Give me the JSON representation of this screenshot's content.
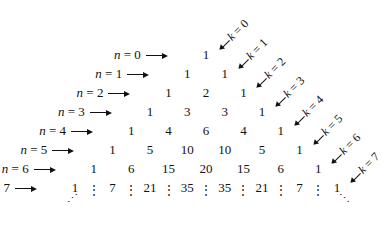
{
  "rows": [
    {
      "label_var": "n",
      "label_eq": " = 0",
      "values": [
        "1"
      ]
    },
    {
      "label_var": "n",
      "label_eq": " = 1",
      "values": [
        "1",
        "1"
      ]
    },
    {
      "label_var": "n",
      "label_eq": " = 2",
      "values": [
        "1",
        "2",
        "1"
      ]
    },
    {
      "label_var": "n",
      "label_eq": " = 3",
      "values": [
        "1",
        "3",
        "3",
        "1"
      ]
    },
    {
      "label_var": "n",
      "label_eq": " = 4",
      "values": [
        "1",
        "4",
        "6",
        "4",
        "1"
      ]
    },
    {
      "label_var": "n",
      "label_eq": " = 5",
      "values": [
        "1",
        "5",
        "10",
        "10",
        "5",
        "1"
      ]
    },
    {
      "label_var": "n",
      "label_eq": " = 6",
      "values": [
        "1",
        "6",
        "15",
        "20",
        "15",
        "6",
        "1"
      ]
    },
    {
      "label_var": "n",
      "label_eq": " = 7",
      "values": [
        "1",
        "7",
        "21",
        "35",
        "35",
        "21",
        "7",
        "1"
      ]
    }
  ],
  "diagonals": [
    {
      "var": "k",
      "eq": " = 0"
    },
    {
      "var": "k",
      "eq": " = 1"
    },
    {
      "var": "k",
      "eq": " = 2"
    },
    {
      "var": "k",
      "eq": " = 3"
    },
    {
      "var": "k",
      "eq": " = 4"
    },
    {
      "var": "k",
      "eq": " = 5"
    },
    {
      "var": "k",
      "eq": " = 6"
    },
    {
      "var": "k",
      "eq": " = 7"
    }
  ],
  "continuation": {
    "vertical": "⋮",
    "left_diag": "⋰",
    "right_diag": "⋱"
  }
}
